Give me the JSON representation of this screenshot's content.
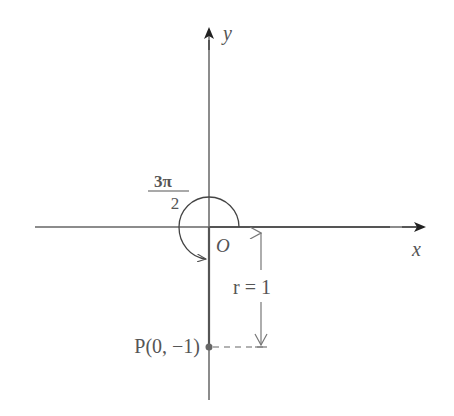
{
  "diagram": {
    "type": "unit-circle-angle",
    "axes": {
      "x_label": "x",
      "y_label": "y",
      "origin_label": "O"
    },
    "angle": {
      "label_numerator": "3π",
      "label_denominator": "2",
      "value": "3π/2",
      "direction": "counterclockwise"
    },
    "point": {
      "label": "P(0, −1)",
      "name": "P",
      "coords": [
        0,
        -1
      ]
    },
    "radius": {
      "label": "r = 1",
      "value": 1
    },
    "colors": {
      "axis": "#555555",
      "text": "#555555",
      "arrowhead": "#222222"
    }
  }
}
